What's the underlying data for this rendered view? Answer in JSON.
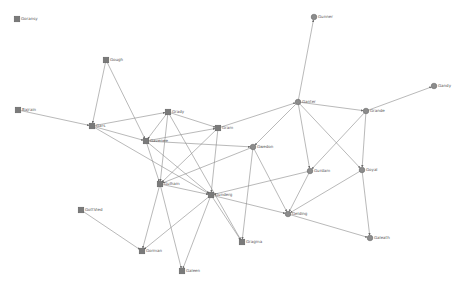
{
  "graph": {
    "background": "#ffffff",
    "edge_color": "#8a8a8a",
    "node_color": "#7a7a7a",
    "nodes": [
      {
        "id": "goransy",
        "label": "Goransy",
        "x": 17,
        "y": 19,
        "shape": "square"
      },
      {
        "id": "gough",
        "label": "Gough",
        "x": 106,
        "y": 60,
        "shape": "square"
      },
      {
        "id": "bajrain",
        "label": "Bajrain",
        "x": 18,
        "y": 110,
        "shape": "square"
      },
      {
        "id": "gars",
        "label": "Gars",
        "x": 92,
        "y": 126,
        "shape": "square"
      },
      {
        "id": "grady",
        "label": "Grady",
        "x": 168,
        "y": 112,
        "shape": "square"
      },
      {
        "id": "gavenee",
        "label": "Gavenee",
        "x": 146,
        "y": 141,
        "shape": "square"
      },
      {
        "id": "gram",
        "label": "Gram",
        "x": 218,
        "y": 128,
        "shape": "square"
      },
      {
        "id": "gwedon",
        "label": "Gwedon",
        "x": 253,
        "y": 147,
        "shape": "circle"
      },
      {
        "id": "gunner",
        "label": "Gunner",
        "x": 314,
        "y": 17,
        "shape": "circle"
      },
      {
        "id": "ganter",
        "label": "Ganter",
        "x": 298,
        "y": 102,
        "shape": "circle"
      },
      {
        "id": "grande",
        "label": "Grande",
        "x": 366,
        "y": 111,
        "shape": "circle"
      },
      {
        "id": "gandy",
        "label": "Gandy",
        "x": 434,
        "y": 86,
        "shape": "circle"
      },
      {
        "id": "gurdam",
        "label": "Gurdam",
        "x": 310,
        "y": 171,
        "shape": "circle"
      },
      {
        "id": "goyal",
        "label": "Goyal",
        "x": 362,
        "y": 170,
        "shape": "circle"
      },
      {
        "id": "gulham",
        "label": "Gulham",
        "x": 160,
        "y": 184,
        "shape": "square"
      },
      {
        "id": "gunderg",
        "label": "Gunderg",
        "x": 211,
        "y": 195,
        "shape": "square"
      },
      {
        "id": "gelding",
        "label": "Gelding",
        "x": 288,
        "y": 214,
        "shape": "circle"
      },
      {
        "id": "gottvied",
        "label": "GottVied",
        "x": 81,
        "y": 210,
        "shape": "square"
      },
      {
        "id": "gorman",
        "label": "Gorman",
        "x": 142,
        "y": 251,
        "shape": "square"
      },
      {
        "id": "gragma",
        "label": "Gragma",
        "x": 242,
        "y": 242,
        "shape": "square"
      },
      {
        "id": "galeath",
        "label": "Galeath",
        "x": 370,
        "y": 238,
        "shape": "circle"
      },
      {
        "id": "galeen",
        "label": "Galeen",
        "x": 182,
        "y": 271,
        "shape": "square"
      }
    ],
    "edges": [
      [
        "gough",
        "gars"
      ],
      [
        "gough",
        "gavenee"
      ],
      [
        "bajrain",
        "gars"
      ],
      [
        "gars",
        "grady"
      ],
      [
        "gars",
        "gavenee"
      ],
      [
        "gars",
        "gunderg"
      ],
      [
        "grady",
        "gavenee"
      ],
      [
        "grady",
        "gram"
      ],
      [
        "grady",
        "gulham"
      ],
      [
        "grady",
        "gragma"
      ],
      [
        "gavenee",
        "gram"
      ],
      [
        "gavenee",
        "gwedon"
      ],
      [
        "gavenee",
        "gulham"
      ],
      [
        "gavenee",
        "gunderg"
      ],
      [
        "gram",
        "ganter"
      ],
      [
        "gram",
        "gulham"
      ],
      [
        "gram",
        "gunderg"
      ],
      [
        "gwedon",
        "gulham"
      ],
      [
        "gwedon",
        "gelding"
      ],
      [
        "gwedon",
        "gragma"
      ],
      [
        "ganter",
        "gunner"
      ],
      [
        "ganter",
        "gwedon"
      ],
      [
        "ganter",
        "grande"
      ],
      [
        "ganter",
        "gurdam"
      ],
      [
        "ganter",
        "goyal"
      ],
      [
        "grande",
        "gandy"
      ],
      [
        "grande",
        "goyal"
      ],
      [
        "grande",
        "gurdam"
      ],
      [
        "gurdam",
        "gelding"
      ],
      [
        "gurdam",
        "gunderg"
      ],
      [
        "goyal",
        "gelding"
      ],
      [
        "goyal",
        "galeath"
      ],
      [
        "gelding",
        "galeath"
      ],
      [
        "gulham",
        "gunderg"
      ],
      [
        "gulham",
        "gorman"
      ],
      [
        "gulham",
        "galeen"
      ],
      [
        "gunderg",
        "gelding"
      ],
      [
        "gunderg",
        "gorman"
      ],
      [
        "gunderg",
        "galeen"
      ],
      [
        "gunderg",
        "gragma"
      ],
      [
        "gottvied",
        "gorman"
      ]
    ]
  }
}
